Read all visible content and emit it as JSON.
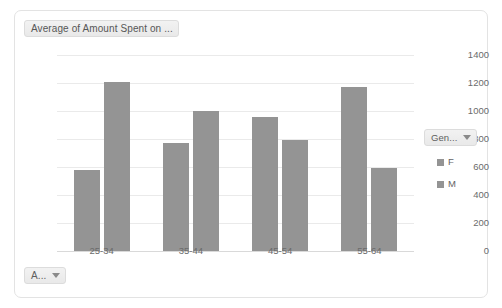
{
  "chart_frame": {
    "title_button": {
      "label": "Average of Amount Spent on ...",
      "icon": "chevron-down-icon"
    },
    "axis_field_button": {
      "label": "A...",
      "icon": "chevron-down-icon"
    },
    "legend_field_button": {
      "label": "Gen...",
      "icon": "chevron-down-icon"
    }
  },
  "legend": {
    "entries": [
      {
        "label": "F",
        "color": "#949494"
      },
      {
        "label": "M",
        "color": "#949494"
      }
    ]
  },
  "chart_data": {
    "type": "bar",
    "title": "Average of Amount Spent on ...",
    "xlabel": "",
    "ylabel": "",
    "categories": [
      "25-34",
      "35-44",
      "45-54",
      "55-64"
    ],
    "series": [
      {
        "name": "F",
        "values": [
          580,
          775,
          960,
          1170
        ],
        "color": "#949494"
      },
      {
        "name": "M",
        "values": [
          1210,
          1000,
          795,
          595
        ],
        "color": "#949494"
      }
    ],
    "ylim": [
      0,
      1400
    ],
    "yticks": [
      0,
      200,
      400,
      600,
      800,
      1000,
      1200,
      1400
    ],
    "ytick_labels": [
      "0",
      "200",
      "400",
      "600",
      "800",
      "1000",
      "1200",
      "1400"
    ],
    "grid": true,
    "legend_position": "right",
    "bar_color": "#949494"
  }
}
